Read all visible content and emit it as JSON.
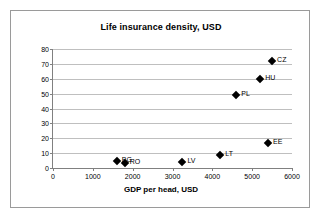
{
  "chart_data": {
    "type": "scatter",
    "title": "Life insurance density, USD",
    "xlabel": "GDP per head, USD",
    "ylabel": "",
    "xlim": [
      0,
      6000
    ],
    "ylim": [
      0,
      80
    ],
    "xticks": [
      0,
      1000,
      2000,
      3000,
      4000,
      5000,
      6000
    ],
    "yticks": [
      0,
      10,
      20,
      30,
      40,
      50,
      60,
      70,
      80
    ],
    "grid": "horizontal",
    "legend": "none",
    "marker_color": "#000000",
    "points": [
      {
        "label": "BG",
        "x": 1600,
        "y": 5
      },
      {
        "label": "RO",
        "x": 1800,
        "y": 3.5
      },
      {
        "label": "LV",
        "x": 3250,
        "y": 4
      },
      {
        "label": "LT",
        "x": 4200,
        "y": 8.5
      },
      {
        "label": "PL",
        "x": 4600,
        "y": 49
      },
      {
        "label": "HU",
        "x": 5200,
        "y": 60
      },
      {
        "label": "EE",
        "x": 5400,
        "y": 17
      },
      {
        "label": "CZ",
        "x": 5500,
        "y": 72
      }
    ]
  },
  "colors": {
    "frame_border": "#9a9a9a",
    "axis": "#808080",
    "gridline": "#bfbfbf",
    "text": "#000000",
    "background": "#ffffff"
  }
}
